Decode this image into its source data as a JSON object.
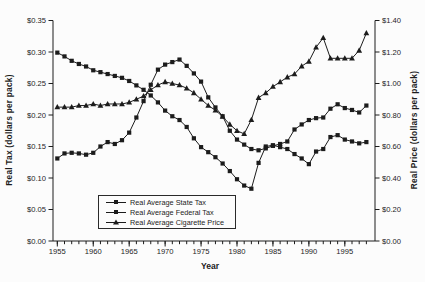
{
  "figure": {
    "background": "#fcfcfc",
    "ink": "#1c1c1c"
  },
  "chart_data": {
    "type": "line",
    "title": "",
    "xlabel": "Year",
    "ylabel_left": "Real Tax (dollars per pack)",
    "ylabel_right": "Real Price (dollars per pack)",
    "x_range": [
      1954.4,
      1999.2
    ],
    "x_major_ticks": [
      1955,
      1960,
      1965,
      1970,
      1975,
      1980,
      1985,
      1990,
      1995
    ],
    "x_major_labels": [
      "1955",
      "1960",
      "1965",
      "1970",
      "1975",
      "1980",
      "1985",
      "1990",
      "1995"
    ],
    "y_left": {
      "min": 0,
      "max": 0.35,
      "step": 0.05,
      "labels": [
        "$0.00",
        "$0.05",
        "$0.10",
        "$0.15",
        "$0.20",
        "$0.25",
        "$0.30",
        "$0.35"
      ]
    },
    "y_right": {
      "min": 0,
      "max": 1.4,
      "step": 0.2,
      "labels": [
        "$0.00",
        "$0.20",
        "$0.40",
        "$0.60",
        "$0.80",
        "$1.00",
        "$1.20",
        "$1.40"
      ]
    },
    "grid": "off",
    "legend_position": "inside-bottom-left",
    "years": [
      1955,
      1956,
      1957,
      1958,
      1959,
      1960,
      1961,
      1962,
      1963,
      1964,
      1965,
      1966,
      1967,
      1968,
      1969,
      1970,
      1971,
      1972,
      1973,
      1974,
      1975,
      1976,
      1977,
      1978,
      1979,
      1980,
      1981,
      1982,
      1983,
      1984,
      1985,
      1986,
      1987,
      1988,
      1989,
      1990,
      1991,
      1992,
      1993,
      1994,
      1995,
      1996,
      1997,
      1998
    ],
    "series": [
      {
        "name": "Real Average State Tax",
        "axis": "left",
        "marker": "square",
        "values": [
          0.131,
          0.139,
          0.14,
          0.139,
          0.137,
          0.14,
          0.15,
          0.157,
          0.154,
          0.16,
          0.172,
          0.196,
          0.222,
          0.248,
          0.272,
          0.28,
          0.284,
          0.288,
          0.278,
          0.266,
          0.253,
          0.228,
          0.212,
          0.198,
          0.175,
          0.161,
          0.153,
          0.146,
          0.144,
          0.147,
          0.151,
          0.154,
          0.158,
          0.177,
          0.185,
          0.192,
          0.195,
          0.196,
          0.21,
          0.217,
          0.211,
          0.208,
          0.204,
          0.215
        ]
      },
      {
        "name": "Real Average Federal Tax",
        "axis": "left",
        "marker": "square",
        "values": [
          0.299,
          0.293,
          0.286,
          0.281,
          0.277,
          0.271,
          0.268,
          0.265,
          0.262,
          0.259,
          0.254,
          0.247,
          0.24,
          0.231,
          0.22,
          0.207,
          0.198,
          0.192,
          0.181,
          0.163,
          0.149,
          0.141,
          0.133,
          0.123,
          0.111,
          0.098,
          0.088,
          0.083,
          0.124,
          0.15,
          0.152,
          0.149,
          0.146,
          0.138,
          0.131,
          0.122,
          0.142,
          0.146,
          0.165,
          0.168,
          0.161,
          0.158,
          0.155,
          0.157
        ]
      },
      {
        "name": "Real Average Cigarette Price",
        "axis": "right",
        "marker": "triangle",
        "values": [
          0.85,
          0.85,
          0.85,
          0.86,
          0.86,
          0.87,
          0.86,
          0.87,
          0.87,
          0.87,
          0.88,
          0.9,
          0.92,
          0.96,
          0.99,
          1.01,
          1.0,
          0.99,
          0.97,
          0.94,
          0.9,
          0.86,
          0.83,
          0.79,
          0.74,
          0.7,
          0.68,
          0.77,
          0.91,
          0.94,
          0.98,
          1.01,
          1.04,
          1.06,
          1.11,
          1.14,
          1.23,
          1.29,
          1.16,
          1.16,
          1.16,
          1.16,
          1.21,
          1.32
        ]
      }
    ]
  },
  "legend": {
    "items": [
      {
        "label": "Real Average State Tax",
        "marker": "square"
      },
      {
        "label": "Real Average Federal Tax",
        "marker": "square"
      },
      {
        "label": "Real Average Cigarette Price",
        "marker": "triangle"
      }
    ]
  }
}
